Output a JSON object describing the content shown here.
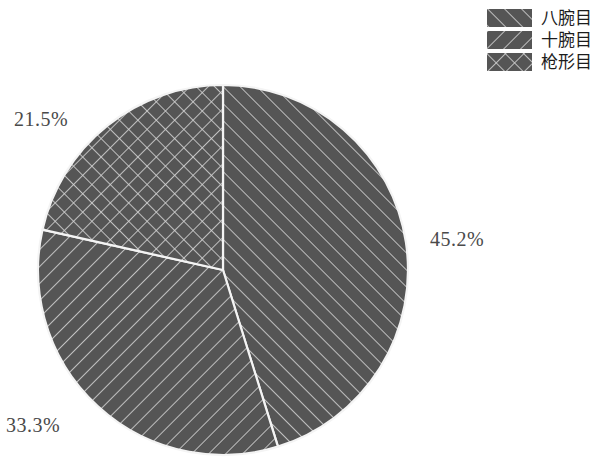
{
  "chart_data": {
    "type": "pie",
    "title": "",
    "labels": [
      "八腕目",
      "十腕目",
      "枪形目"
    ],
    "values": [
      45.2,
      33.3,
      21.5
    ],
    "value_labels": [
      "45.2%",
      "33.3%",
      "21.5%"
    ],
    "legend_position": "top-right",
    "grid": false,
    "start_angle_deg": 90,
    "direction": "clockwise",
    "slice_patterns": [
      "forward-diagonal",
      "back-diagonal",
      "cross-hatch"
    ],
    "slice_fill": "#555555",
    "hatch_color": "#d9d9d9",
    "edge_color": "#f2f2f2",
    "background": "#ffffff"
  },
  "legend": {
    "items": [
      {
        "label": "八腕目",
        "pattern": "forward-diagonal"
      },
      {
        "label": "十腕目",
        "pattern": "back-diagonal"
      },
      {
        "label": "枪形目",
        "pattern": "cross-hatch"
      }
    ]
  },
  "labels": {
    "slice_0": "45.2%",
    "slice_1": "33.3%",
    "slice_2": "21.5%"
  }
}
